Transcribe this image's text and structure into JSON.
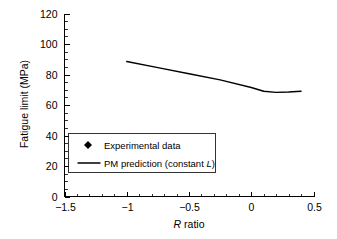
{
  "chart_data": {
    "type": "line",
    "title": "",
    "xlabel": "R ratio",
    "xlabel_italic_prefix": "R",
    "xlabel_rest": " ratio",
    "ylabel": "Fatigue limit (MPa)",
    "xlim": [
      -1.5,
      0.5
    ],
    "ylim": [
      0,
      120
    ],
    "grid": false,
    "legend_position": "lower-left-inside",
    "xticks": [
      -1.5,
      -1,
      -0.5,
      0,
      0.5
    ],
    "xticklabels": [
      "−1.5",
      "−1",
      "−0.5",
      "0",
      "0.5"
    ],
    "xtick_minor_step": 0.1,
    "yticks": [
      0,
      20,
      40,
      60,
      80,
      100,
      120
    ],
    "yticklabels": [
      "0",
      "20",
      "40",
      "60",
      "80",
      "100",
      "120"
    ],
    "ytick_minor_step": 5,
    "series": [
      {
        "name": "Experimental data",
        "type": "scatter",
        "marker": "diamond",
        "color": "#000000",
        "points": [
          {
            "x": -1,
            "y": 96
          },
          {
            "x": 0,
            "y": 63
          },
          {
            "x": 0.4,
            "y": 63
          }
        ]
      },
      {
        "name": "PM prediction (constant L)",
        "type": "line",
        "color": "#000000",
        "points": [
          {
            "x": -1,
            "y": 88.5
          },
          {
            "x": -0.75,
            "y": 84.5
          },
          {
            "x": -0.5,
            "y": 80.5
          },
          {
            "x": -0.25,
            "y": 76.5
          },
          {
            "x": 0,
            "y": 71.5
          },
          {
            "x": 0.1,
            "y": 69
          },
          {
            "x": 0.2,
            "y": 68.3
          },
          {
            "x": 0.3,
            "y": 68.5
          },
          {
            "x": 0.4,
            "y": 69
          }
        ]
      }
    ]
  },
  "legend": {
    "entries": [
      {
        "label": "Experimental data",
        "symbol": "diamond"
      },
      {
        "label_prefix": "PM prediction (constant ",
        "label_italic": "L",
        "label_suffix": ")",
        "symbol": "line"
      }
    ]
  },
  "colors": {
    "background": "#ffffff",
    "foreground": "#000000"
  }
}
